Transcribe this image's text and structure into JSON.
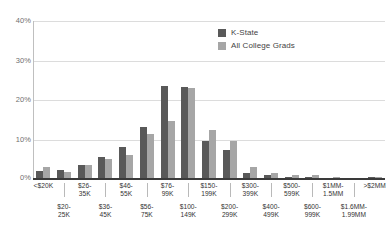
{
  "chart_data": {
    "type": "bar",
    "title": "",
    "subtitle": "",
    "xlabel": "",
    "ylabel": "",
    "ylim": [
      0,
      40
    ],
    "yticks": [
      0,
      10,
      20,
      30,
      40
    ],
    "ytick_labels": [
      "0%",
      "10%",
      "20%",
      "30%",
      "40%"
    ],
    "grid": true,
    "legend_position": "top-right",
    "value_unit": "percent",
    "categories": [
      "<$20K",
      "$20-\n25K",
      "$26-\n35K",
      "$36-\n45K",
      "$46-\n55K",
      "$56-\n75K",
      "$76-\n99K",
      "$100-\n149K",
      "$150-\n199K",
      "$200-\n299K",
      "$300-\n399K",
      "$400-\n499K",
      "$500-\n599K",
      "$600-\n999K",
      "$1MM-\n1.5MM",
      "$1.6MM-\n1.99MM",
      ">$2MM"
    ],
    "series": [
      {
        "name": "K-State",
        "color": "#595959",
        "values": [
          2.0,
          2.4,
          3.5,
          5.7,
          8.0,
          13.1,
          23.6,
          23.3,
          9.5,
          7.4,
          1.5,
          0.9,
          0.4,
          0.6,
          0.35,
          0.2,
          0.6
        ]
      },
      {
        "name": "All College Grads",
        "color": "#a6a6a6",
        "values": [
          3.0,
          1.9,
          3.6,
          5.0,
          6.0,
          11.3,
          14.8,
          23.1,
          12.5,
          9.7,
          3.0,
          1.4,
          1.1,
          1.0,
          0.6,
          0.3,
          0.5
        ]
      }
    ]
  },
  "legend": {
    "items": [
      {
        "label": "K-State",
        "color": "#595959"
      },
      {
        "label": "All College Grads",
        "color": "#a6a6a6"
      }
    ]
  },
  "axis": {
    "y_tick_labels": [
      "40%",
      "30%",
      "20%",
      "10%",
      "0%"
    ]
  },
  "colors": {
    "series_kstate": "#595959",
    "series_all_grads": "#a6a6a6",
    "gridline": "#dcdcdc",
    "baseline": "#3a3a3a",
    "text": "#333333",
    "tick_text": "#6f6f6f"
  }
}
